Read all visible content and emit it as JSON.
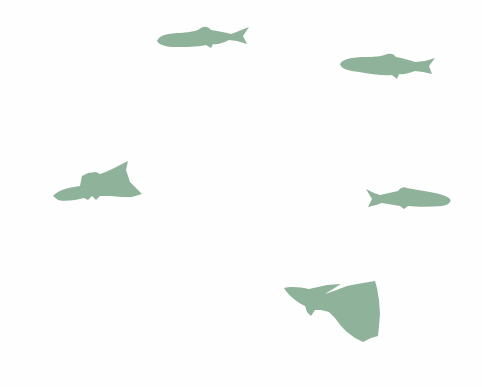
{
  "scene": {
    "background": "#fefefe",
    "fish_color": "#8fb39a",
    "fish": [
      {
        "id": "fish-1",
        "kind": "minnow",
        "facing": "left",
        "x": 155,
        "y": 24,
        "w": 96,
        "h": 28
      },
      {
        "id": "fish-2",
        "kind": "minnow",
        "facing": "left",
        "x": 339,
        "y": 52,
        "w": 97,
        "h": 30
      },
      {
        "id": "fish-3",
        "kind": "guppy",
        "facing": "left",
        "x": 52,
        "y": 160,
        "w": 90,
        "h": 46
      },
      {
        "id": "fish-4",
        "kind": "minnow",
        "facing": "right",
        "x": 364,
        "y": 185,
        "w": 88,
        "h": 26
      },
      {
        "id": "fish-5",
        "kind": "guppy",
        "facing": "left",
        "x": 283,
        "y": 280,
        "w": 100,
        "h": 62
      }
    ]
  }
}
